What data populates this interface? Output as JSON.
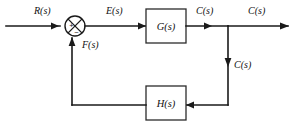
{
  "diagram": {
    "type": "control-block-diagram",
    "canvas": {
      "width": 295,
      "height": 127,
      "background": "#ffffff"
    },
    "stroke_color": "#1a1a1a",
    "blocks": [
      {
        "id": "forward-block",
        "label": "G(s)",
        "x": 146,
        "y": 9,
        "w": 40,
        "h": 34
      },
      {
        "id": "feedback-block",
        "label": "H(s)",
        "x": 146,
        "y": 86,
        "w": 40,
        "h": 34
      }
    ],
    "summing_junction": {
      "id": "summing-junction",
      "cx": 75,
      "cy": 26,
      "r": 10,
      "plus_sign": "+",
      "minus_sign": "−"
    },
    "signals": {
      "input": "R(s)",
      "error": "E(s)",
      "forward_output": "C(s)",
      "system_output": "C(s)",
      "branch": "C(s)",
      "feedback": "F(s)"
    },
    "labels": [
      {
        "id": "label-input",
        "text": "R(s)",
        "x": 34,
        "y": 14
      },
      {
        "id": "label-error",
        "text": "E(s)",
        "x": 106,
        "y": 14
      },
      {
        "id": "label-forward-output",
        "text": "C(s)",
        "x": 196,
        "y": 14
      },
      {
        "id": "label-system-output",
        "text": "C(s)",
        "x": 248,
        "y": 14
      },
      {
        "id": "label-branch",
        "text": "C(s)",
        "x": 234,
        "y": 68
      },
      {
        "id": "label-feedback",
        "text": "F(s)",
        "x": 82,
        "y": 48
      }
    ]
  }
}
